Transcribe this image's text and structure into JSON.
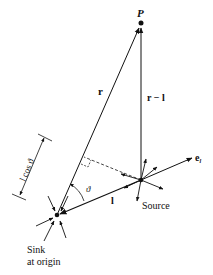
{
  "diagram": {
    "labels": {
      "point": "P",
      "r_vector": "r",
      "r_minus_l": "r − l",
      "l_vector": "l",
      "unit_vector_e": "e",
      "unit_vector_sub": "l",
      "angle": "ϑ",
      "projection": "l cos ϑ",
      "source": "Source",
      "sink_line1": "Sink",
      "sink_line2": "at origin"
    },
    "colors": {
      "ink": "#111111",
      "background": "#ffffff"
    }
  }
}
